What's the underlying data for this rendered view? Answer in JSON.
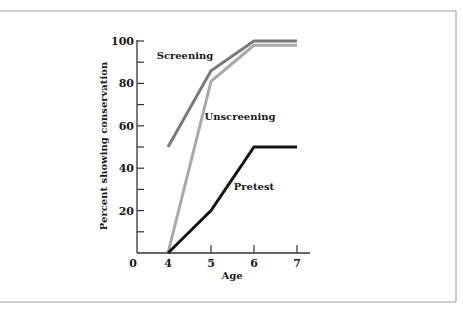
{
  "chart_data": {
    "type": "line",
    "title": "",
    "xlabel": "Age",
    "ylabel": "Percent showing conservation",
    "x": [
      4,
      5,
      6,
      7
    ],
    "xlim": [
      3.1,
      7.3
    ],
    "ylim": [
      0,
      100
    ],
    "xticks": [
      4,
      5,
      6,
      7
    ],
    "yticks": [
      20,
      40,
      60,
      80,
      100
    ],
    "yticks_minor": [
      10,
      30,
      50,
      70,
      90
    ],
    "origin_label": "0",
    "grid": false,
    "legend": "inline labels",
    "series": [
      {
        "name": "Screening",
        "values": [
          50,
          86,
          100,
          100
        ],
        "color": "#7a7a7a",
        "label_pos": [
          185,
          59
        ]
      },
      {
        "name": "Unscreening",
        "values": [
          0,
          81,
          98,
          98
        ],
        "color": "#a9a9a9",
        "label_pos": [
          240,
          120
        ]
      },
      {
        "name": "Pretest",
        "values": [
          0,
          20,
          50,
          50
        ],
        "color": "#141414",
        "label_pos": [
          254,
          190
        ]
      }
    ]
  }
}
